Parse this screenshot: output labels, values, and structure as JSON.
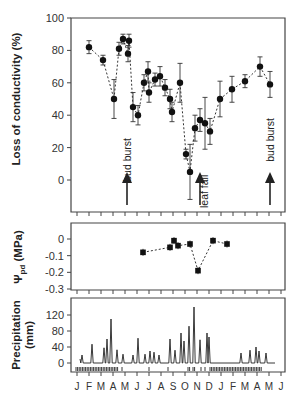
{
  "chart_data": [
    {
      "type": "scatter",
      "panel": "top",
      "ylabel": "Loss of conductivity (%)",
      "ylim": [
        -20,
        100
      ],
      "yticks": [
        0,
        20,
        40,
        60,
        80,
        100
      ],
      "x_months": [
        "J",
        "F",
        "M",
        "A",
        "M",
        "J",
        "J",
        "A",
        "S",
        "O",
        "N",
        "D",
        "J",
        "F",
        "M",
        "A",
        "M",
        "J"
      ],
      "line_style": "dashed",
      "points": [
        {
          "x": 89,
          "y": 82,
          "err": 4
        },
        {
          "x": 103,
          "y": 74,
          "err": 3
        },
        {
          "x": 114,
          "y": 50,
          "err": 12
        },
        {
          "x": 119,
          "y": 81,
          "err": 4
        },
        {
          "x": 123,
          "y": 87,
          "err": 3
        },
        {
          "x": 128,
          "y": 78,
          "err": 5
        },
        {
          "x": 129,
          "y": 86,
          "err": 4
        },
        {
          "x": 133,
          "y": 45,
          "err": 9
        },
        {
          "x": 138,
          "y": 40,
          "err": 6
        },
        {
          "x": 144,
          "y": 60,
          "err": 5
        },
        {
          "x": 148,
          "y": 67,
          "err": 6
        },
        {
          "x": 149,
          "y": 54,
          "err": 6
        },
        {
          "x": 155,
          "y": 62,
          "err": 4
        },
        {
          "x": 160,
          "y": 64,
          "err": 6
        },
        {
          "x": 165,
          "y": 57,
          "err": 5
        },
        {
          "x": 170,
          "y": 50,
          "err": 6
        },
        {
          "x": 172,
          "y": 42,
          "err": 6
        },
        {
          "x": 180,
          "y": 60,
          "err": 12
        },
        {
          "x": 186,
          "y": 16,
          "err": 3
        },
        {
          "x": 190,
          "y": 5,
          "err": 17
        },
        {
          "x": 195,
          "y": 32,
          "err": 8
        },
        {
          "x": 200,
          "y": 37,
          "err": 7
        },
        {
          "x": 205,
          "y": 35,
          "err": 16
        },
        {
          "x": 210,
          "y": 30,
          "err": 8
        },
        {
          "x": 220,
          "y": 50,
          "err": 11
        },
        {
          "x": 232,
          "y": 56,
          "err": 8
        },
        {
          "x": 245,
          "y": 61,
          "err": 4
        },
        {
          "x": 260,
          "y": 70,
          "err": 6
        },
        {
          "x": 270,
          "y": 59,
          "err": 8
        }
      ],
      "annotations": [
        {
          "text": "bud burst",
          "x": 127
        },
        {
          "text": "leaf fall",
          "x": 200
        },
        {
          "text": "bud burst",
          "x": 270
        }
      ]
    },
    {
      "type": "scatter",
      "panel": "middle",
      "ylabel": "Ψpd (MPa)",
      "ylim": [
        -0.3,
        0.1
      ],
      "yticks": [
        0,
        -0.1,
        -0.2,
        -0.3
      ],
      "line_style": "dashed",
      "points": [
        {
          "x": 143,
          "y": -0.08
        },
        {
          "x": 170,
          "y": -0.05
        },
        {
          "x": 174,
          "y": -0.01
        },
        {
          "x": 178,
          "y": -0.04
        },
        {
          "x": 190,
          "y": -0.03
        },
        {
          "x": 198,
          "y": -0.19
        },
        {
          "x": 213,
          "y": -0.01
        },
        {
          "x": 227,
          "y": -0.03
        }
      ]
    },
    {
      "type": "line",
      "panel": "bottom",
      "ylabel": "Precipitation (mm)",
      "ylim": [
        -10,
        140
      ],
      "yticks": [
        0,
        40,
        80,
        120
      ],
      "x_months": [
        "J",
        "F",
        "M",
        "A",
        "M",
        "J",
        "J",
        "A",
        "S",
        "O",
        "N",
        "D",
        "J",
        "F",
        "M",
        "A",
        "M",
        "J"
      ],
      "peaks": [
        {
          "x": 82,
          "y": 20
        },
        {
          "x": 92,
          "y": 47
        },
        {
          "x": 104,
          "y": 38
        },
        {
          "x": 107,
          "y": 60
        },
        {
          "x": 111,
          "y": 110
        },
        {
          "x": 117,
          "y": 33
        },
        {
          "x": 123,
          "y": 22
        },
        {
          "x": 133,
          "y": 20
        },
        {
          "x": 138,
          "y": 62
        },
        {
          "x": 145,
          "y": 22
        },
        {
          "x": 150,
          "y": 30
        },
        {
          "x": 154,
          "y": 27
        },
        {
          "x": 159,
          "y": 20
        },
        {
          "x": 170,
          "y": 60
        },
        {
          "x": 175,
          "y": 32
        },
        {
          "x": 181,
          "y": 75
        },
        {
          "x": 184,
          "y": 55
        },
        {
          "x": 189,
          "y": 92
        },
        {
          "x": 194,
          "y": 140
        },
        {
          "x": 200,
          "y": 58
        },
        {
          "x": 207,
          "y": 75
        },
        {
          "x": 209,
          "y": 65
        },
        {
          "x": 241,
          "y": 25
        },
        {
          "x": 250,
          "y": 32
        },
        {
          "x": 256,
          "y": 40
        },
        {
          "x": 259,
          "y": 30
        },
        {
          "x": 266,
          "y": 25
        }
      ]
    }
  ],
  "labels": {
    "top_ylabel": "Loss of conductivity (%)",
    "mid_ylabel_main": "Ψ",
    "mid_ylabel_sub": "pd",
    "mid_ylabel_unit": " (MPa)",
    "bot_ylabel_1": "Precipitation",
    "bot_ylabel_2": "(mm)",
    "annot_bud1": "bud burst",
    "annot_leaf": "leaf fall",
    "annot_bud2": "bud burst",
    "top_ticks": [
      "100",
      "80",
      "60",
      "40",
      "20",
      "0"
    ],
    "mid_ticks": [
      "0",
      "-0.1",
      "-0.2",
      "-0.3"
    ],
    "bot_ticks": [
      "120",
      "80",
      "40",
      "0"
    ],
    "months": [
      "J",
      "F",
      "M",
      "A",
      "M",
      "J",
      "J",
      "A",
      "S",
      "O",
      "N",
      "D",
      "J",
      "F",
      "M",
      "A",
      "M",
      "J"
    ]
  }
}
